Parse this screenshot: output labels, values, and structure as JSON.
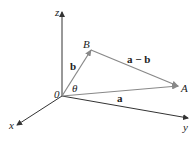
{
  "diagram": {
    "type": "3d-vector-diagram",
    "axes": {
      "x": {
        "label": "x"
      },
      "y": {
        "label": "y"
      },
      "z": {
        "label": "z"
      }
    },
    "origin": {
      "label": "0"
    },
    "points": {
      "A": {
        "label": "A"
      },
      "B": {
        "label": "B"
      }
    },
    "vectors": {
      "a": {
        "label": "a",
        "from": "0",
        "to": "A"
      },
      "b": {
        "label": "b",
        "from": "0",
        "to": "B"
      },
      "a_minus_b": {
        "label": "a − b",
        "from": "B",
        "to": "A"
      }
    },
    "angle": {
      "label": "θ",
      "between": [
        "a",
        "b"
      ]
    },
    "colors": {
      "axis": "#333333",
      "vector": "#888888",
      "text": "#222222"
    }
  }
}
